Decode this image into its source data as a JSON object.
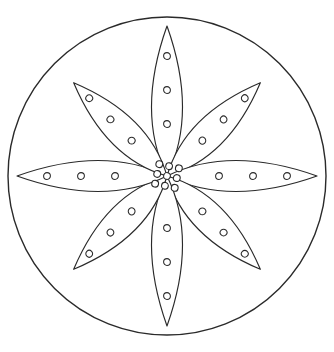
{
  "artwork": {
    "title": "Flower Mandala Coloring Page",
    "style": "line-art-outline",
    "background_color": "#ffffff",
    "stroke_color": "#2a2a2a",
    "fill_color": "#ffffff"
  },
  "canvas": {
    "width": 334,
    "height": 352,
    "center_x": 167,
    "center_y": 176
  },
  "outer_circle": {
    "name": "outer-boundary-circle",
    "center_x": 167,
    "center_y": 176,
    "radius": 159,
    "stroke_width": 1.4
  },
  "petals": {
    "count": 8,
    "dots_per_petal": 3,
    "items": [
      {
        "label": "petal-north",
        "angle": -90,
        "length": 150,
        "half_width": 31,
        "dot_radius": 3.4,
        "dot_offsets": [
          52,
          86,
          120
        ]
      },
      {
        "label": "petal-northeast",
        "angle": -45,
        "length": 132,
        "half_width": 31,
        "dot_radius": 3.4,
        "dot_offsets": [
          50,
          80,
          110
        ]
      },
      {
        "label": "petal-east",
        "angle": 0,
        "length": 150,
        "half_width": 31,
        "dot_radius": 3.4,
        "dot_offsets": [
          52,
          86,
          120
        ]
      },
      {
        "label": "petal-southeast",
        "angle": 45,
        "length": 132,
        "half_width": 31,
        "dot_radius": 3.4,
        "dot_offsets": [
          50,
          80,
          110
        ]
      },
      {
        "label": "petal-south",
        "angle": 90,
        "length": 150,
        "half_width": 31,
        "dot_radius": 3.4,
        "dot_offsets": [
          52,
          86,
          120
        ]
      },
      {
        "label": "petal-southwest",
        "angle": 135,
        "length": 132,
        "half_width": 31,
        "dot_radius": 3.4,
        "dot_offsets": [
          50,
          80,
          110
        ]
      },
      {
        "label": "petal-west",
        "angle": 180,
        "length": 150,
        "half_width": 31,
        "dot_radius": 3.4,
        "dot_offsets": [
          52,
          86,
          120
        ]
      },
      {
        "label": "petal-northwest",
        "angle": -135,
        "length": 132,
        "half_width": 31,
        "dot_radius": 3.4,
        "dot_offsets": [
          50,
          80,
          110
        ]
      }
    ]
  },
  "center_cluster": {
    "name": "center-dot-cluster",
    "dot_count": 9,
    "dot_radius": 3.4,
    "spacing": 10,
    "rotation_deg": 12,
    "grid": [
      {
        "col": -1,
        "row": -1
      },
      {
        "col": 0,
        "row": -1
      },
      {
        "col": 1,
        "row": -1
      },
      {
        "col": -1,
        "row": 0
      },
      {
        "col": 0,
        "row": 0
      },
      {
        "col": 1,
        "row": 0
      },
      {
        "col": -1,
        "row": 1
      },
      {
        "col": 0,
        "row": 1
      },
      {
        "col": 1,
        "row": 1
      }
    ]
  }
}
